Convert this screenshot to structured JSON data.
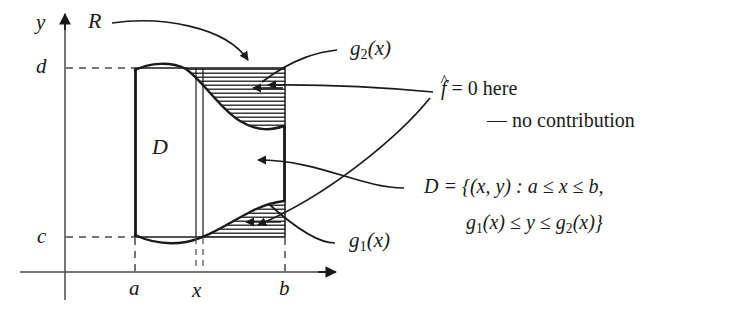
{
  "figure": {
    "type": "math-region-diagram",
    "background_color": "#ffffff",
    "ink_color": "#1a1a1a",
    "axes": {
      "y_axis_label": "y",
      "x_axis_label": "",
      "x_axis_y_px": 272,
      "y_axis_x_px": 65,
      "x_axis_end_px": 338,
      "y_axis_top_px": 14
    },
    "ticks": {
      "y": [
        {
          "label": "c",
          "y_px": 237
        },
        {
          "label": "d",
          "y_px": 68
        }
      ],
      "x": [
        {
          "label": "a",
          "x_px": 135
        },
        {
          "label": "x",
          "x_px": 199
        },
        {
          "label": "b",
          "x_px": 285
        }
      ]
    },
    "rectangle": {
      "name": "R",
      "label": "R",
      "left_px": 135,
      "right_px": 285,
      "top_px": 68,
      "bottom_px": 237
    },
    "region": {
      "label": "D",
      "label_x_px": 158,
      "label_y_px": 148
    },
    "curves": {
      "upper_label": "g",
      "upper_sub": "2",
      "upper_arg": "(x)",
      "lower_label": "g",
      "lower_sub": "1",
      "lower_arg": "(x)"
    },
    "slice": {
      "x_px": 199,
      "width_px": 7
    },
    "annotations": {
      "zero_line1_prefix": "f",
      "zero_line1_hat": "^",
      "zero_line1_rest": " = 0 here",
      "zero_line2": "— no contribution",
      "set_line1_lead": "D",
      "set_line1_rest": " = {(x, y) : a ≤ x ≤ b,",
      "set_line2": "g",
      "set_line2_sub": "1",
      "set_line2_rest": "(x) ≤ y ≤ g",
      "set_line2_sub2": "2",
      "set_line2_tail": "(x)}"
    },
    "hatching": {
      "style": "horizontal-lines",
      "spacing_px": 4,
      "color": "#1a1a1a",
      "meaning": "f-hat = 0 here - no contribution"
    }
  }
}
